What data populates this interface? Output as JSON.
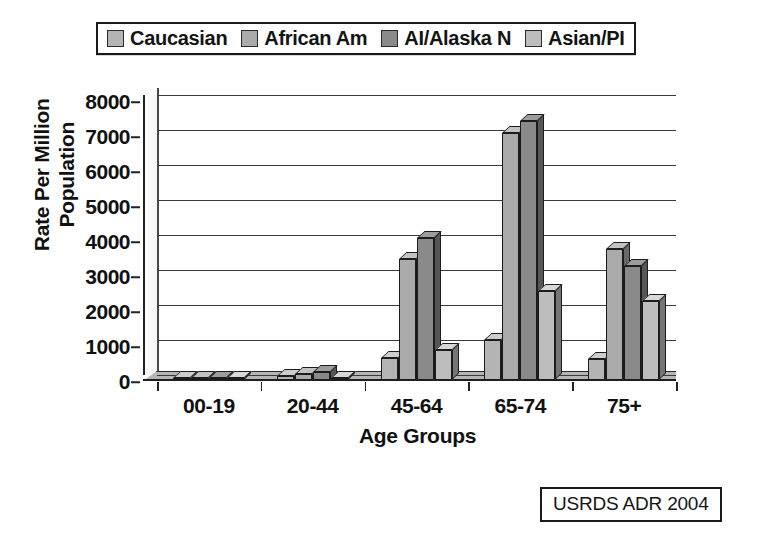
{
  "legend": {
    "items": [
      {
        "label": "Caucasian",
        "color": "#b4b4b4"
      },
      {
        "label": "African Am",
        "color": "#aaaaaa"
      },
      {
        "label": "AI/Alaska N",
        "color": "#8a8a8a"
      },
      {
        "label": "Asian/PI",
        "color": "#bdbdbd"
      }
    ]
  },
  "source": {
    "text": "USRDS ADR 2004"
  },
  "chart_data": {
    "type": "bar",
    "title": "",
    "xlabel": "Age Groups",
    "ylabel": "Rate Per Million Population",
    "ylabel_line1": "Rate Per Million",
    "ylabel_line2": "Population",
    "categories": [
      "00-19",
      "20-44",
      "45-64",
      "65-74",
      "75+"
    ],
    "yticks": [
      0,
      1000,
      2000,
      3000,
      4000,
      5000,
      6000,
      7000,
      8000
    ],
    "ylim": [
      0,
      8000
    ],
    "grid": true,
    "legend_position": "top",
    "series": [
      {
        "name": "Caucasian",
        "color": "#b4b4b4",
        "values": [
          15,
          110,
          620,
          1150,
          600
        ]
      },
      {
        "name": "African Am",
        "color": "#aaaaaa",
        "values": [
          15,
          185,
          3450,
          7050,
          3750
        ]
      },
      {
        "name": "AI/Alaska N",
        "color": "#8a8a8a",
        "values": [
          20,
          230,
          4050,
          7400,
          3250
        ]
      },
      {
        "name": "Asian/PI",
        "color": "#bdbdbd",
        "values": [
          10,
          60,
          860,
          2550,
          2250
        ]
      }
    ]
  }
}
